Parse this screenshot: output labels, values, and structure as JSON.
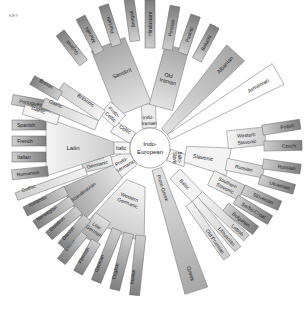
{
  "key_label": "KEY",
  "center": {
    "label_line1": "Indo-",
    "label_line2": "European"
  },
  "colors": {
    "dark": "#8c8c8c",
    "mid": "#b4b4b4",
    "light": "#d6d6d6",
    "pale": "#ececec",
    "stroke": "#777777"
  },
  "branches": {
    "indo_iranian": {
      "label_line1": "Indo-",
      "label_line2": "Iranian"
    },
    "sanskrit": "Sanskrit",
    "sanskrit_children": [
      "Gujarati",
      "Marathi",
      "Punjabi",
      "Bengali",
      "Hindustani"
    ],
    "old_iranian": {
      "label_line1": "Old",
      "label_line2": "Iranian"
    },
    "old_iranian_children": [
      "Persian",
      "Pashto",
      "Baluchi"
    ],
    "albanian": "Albanian",
    "armenian": "Armenian",
    "balto_slavic": {
      "label_line1": "Balto-",
      "label_line2": "Slavic"
    },
    "slavonic": "Slavonic",
    "western_slavonic": {
      "label_line1": "Western",
      "label_line2": "Slavonic"
    },
    "western_slavonic_children": [
      "Polish",
      "Czech"
    ],
    "russian_group": "Russian",
    "russian_children": [
      "Russian",
      "Ukrainian"
    ],
    "southern_slavonic": {
      "label_line1": "Southern",
      "label_line2": "Slavonic"
    },
    "southern_slavonic_children": [
      "Slovenian",
      "Serbo-Croat",
      "Bulgarian"
    ],
    "baltic": "Baltic",
    "baltic_children": [
      "Lettish",
      "Lithuanian",
      "Old Prussian"
    ],
    "proto_greek": "Proto-Greek",
    "greek": "Greek",
    "proto_germanic": {
      "label_line1": "Proto-",
      "label_line2": "Germanic"
    },
    "western_germanic": {
      "label_line1": "Western",
      "label_line2": "Germanic"
    },
    "low_german": {
      "label_line1": "Low",
      "label_line2": "German"
    },
    "low_german_children": [
      "Dutch",
      "Flemish"
    ],
    "western_germanic_children": [
      "German",
      "English",
      "Frisian"
    ],
    "eastern_germanic": {
      "label_line1": "Eastern",
      "label_line2": "Germanic"
    },
    "gothic": "Gothic",
    "scandinavian": "Scandinavian",
    "scandinavian_children": [
      "Icelandic",
      "Norwegian",
      "Swedish",
      "Danish"
    ],
    "italic": "Italic",
    "latin": "Latin",
    "latin_children": [
      "Portuguese",
      "Spanish",
      "French",
      "Italian",
      "Romanian"
    ],
    "proto_celtic": {
      "label_line1": "Proto-",
      "label_line2": "Celtic"
    },
    "celtic": "Celtic",
    "britannic": "Britannic",
    "britannic_children": [
      "Breton"
    ],
    "gaelic_group": "Gaelic",
    "gaelic_children": [
      "Gaelic"
    ]
  }
}
